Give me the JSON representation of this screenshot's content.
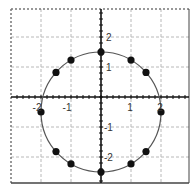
{
  "chart_data": {
    "type": "scatter",
    "title": "",
    "xlabel": "",
    "ylabel": "",
    "xlim": [
      -3.0,
      2.9
    ],
    "ylim": [
      -2.9,
      2.9
    ],
    "grid": true,
    "x_ticks": [
      -2,
      -1,
      1,
      2
    ],
    "y_ticks": [
      -2,
      -1,
      1,
      2
    ],
    "x_tick_labels": [
      "-2",
      "-1",
      "1",
      "2"
    ],
    "y_tick_labels": [
      "-2",
      "-1",
      "1",
      "2"
    ],
    "curve": {
      "shape": "circle",
      "center": [
        0,
        -0.5
      ],
      "radius": 2,
      "color": "#555555"
    },
    "series": [
      {
        "name": "points",
        "color": "#111111",
        "points": [
          [
            0,
            1.5
          ],
          [
            1,
            1.23
          ],
          [
            1.5,
            0.82
          ],
          [
            2,
            -0.5
          ],
          [
            1.5,
            -1.82
          ],
          [
            1,
            -2.23
          ],
          [
            0,
            -2.5
          ],
          [
            -1,
            -2.23
          ],
          [
            -1.5,
            -1.82
          ],
          [
            -2,
            -0.5
          ],
          [
            -1.5,
            0.82
          ],
          [
            -1,
            1.23
          ]
        ]
      }
    ]
  },
  "colors": {
    "axis": "#111111",
    "grid": "#b8b8b8",
    "frame": "#444444"
  }
}
